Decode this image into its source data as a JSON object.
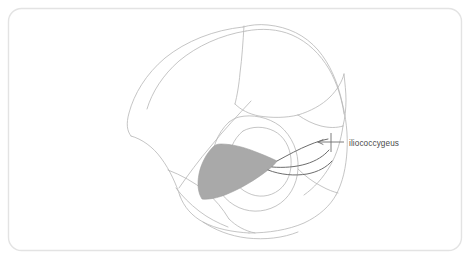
{
  "figure": {
    "name": "pelvic-floor-anatomy-illustration",
    "type": "line-drawing",
    "background_color": "#ffffff",
    "frame": {
      "name": "rounded-border-frame",
      "stroke_color": "#e3e3e3",
      "stroke_width": 1.4,
      "corner_radius": 13,
      "x": 8.5,
      "y": 8.5,
      "width": 453,
      "height": 242
    },
    "line_art": {
      "stroke_color_light": "#b6b6b6",
      "stroke_color_mid": "#9a9a9a",
      "stroke_color_dark": "#6d6d6d",
      "stroke_width_light": 0.8,
      "stroke_width_dark": 1.1
    },
    "shaded_muscle": {
      "name": "iliococcygeus-muscle-shading",
      "fill_color": "#a9a9a9",
      "stroke_color": "#9a9a9a"
    }
  },
  "annotations": [
    {
      "id": "iliococcygeus",
      "label": "iliococcygeus",
      "text_color": "#4a4a4a",
      "text_x": 349,
      "text_y": 146,
      "leader_line": {
        "name": "leader-line-iliococcygeus",
        "color": "#6d6d6d",
        "width": 1,
        "x1": 344,
        "y1": 142,
        "x2": 318,
        "y2": 142
      },
      "tick": {
        "x": 331,
        "y1": 133,
        "y2": 152
      }
    }
  ]
}
